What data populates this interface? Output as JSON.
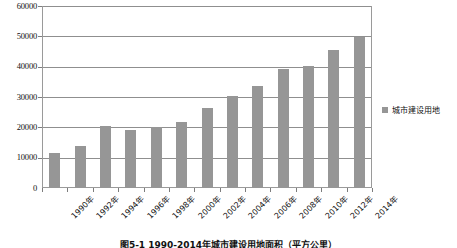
{
  "chart_data": {
    "type": "bar",
    "title": "图5-1 1990-2014年城市建设用地面积（平方公里）",
    "xlabel": "",
    "ylabel": "",
    "ylim": [
      0,
      60000
    ],
    "grid": true,
    "legend_position": "right",
    "legend": [
      "城市建设用地"
    ],
    "categories": [
      "1990年",
      "1992年",
      "1994年",
      "1996年",
      "1998年",
      "2000年",
      "2002年",
      "2004年",
      "2006年",
      "2008年",
      "2010年",
      "2012年",
      "2014年"
    ],
    "values": [
      11600,
      14000,
      20500,
      19000,
      20100,
      21800,
      26500,
      30300,
      33700,
      39100,
      40100,
      45600,
      49800
    ],
    "yticks": [
      0,
      10000,
      20000,
      30000,
      40000,
      50000,
      60000
    ],
    "ytick_labels": [
      "0",
      "10000",
      "20000",
      "30000",
      "40000",
      "50000",
      "60000"
    ],
    "series": [
      {
        "name": "城市建设用地",
        "color": "#969696",
        "values": [
          11600,
          14000,
          20500,
          19000,
          20100,
          21800,
          26500,
          30300,
          33700,
          39100,
          40100,
          45600,
          49800
        ]
      }
    ]
  },
  "caption": {
    "text": "图5-1 1990-2014年城市建设用地面积（平方公里）"
  },
  "colors": {
    "bar": "#969696",
    "grid": "#8f8f8f",
    "axis": "#9a9a9a",
    "text": "#111111"
  }
}
